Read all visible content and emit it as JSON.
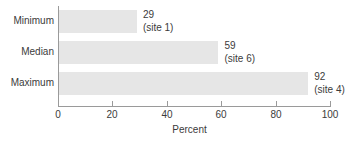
{
  "chart_data": {
    "type": "bar",
    "orientation": "horizontal",
    "title": "",
    "subtitle": "",
    "xlabel": "Percent",
    "ylabel": "",
    "xlim": [
      0,
      100
    ],
    "grid": false,
    "legend": null,
    "categories": [
      "Minimum",
      "Median",
      "Maximum"
    ],
    "values": [
      29,
      59,
      92
    ],
    "annotations": [
      "(site 1)",
      "(site 6)",
      "(site 4)"
    ],
    "value_labels": [
      "29",
      "59",
      "92"
    ],
    "xticks": [
      0,
      20,
      40,
      60,
      80,
      100
    ],
    "xtick_labels": [
      "0",
      "20",
      "40",
      "60",
      "80",
      "100"
    ],
    "series": [
      {
        "name": "Percent",
        "points": [
          {
            "category": "Minimum",
            "value": 29,
            "value_label": "29",
            "annotation": "(site 1)"
          },
          {
            "category": "Median",
            "value": 59,
            "value_label": "59",
            "annotation": "(site 6)"
          },
          {
            "category": "Maximum",
            "value": 92,
            "value_label": "92",
            "annotation": "(site 4)"
          }
        ]
      }
    ],
    "colors": {
      "bar_fill": "#e6e6e6",
      "axis": "#9a9a9a",
      "text": "#3b3b3b",
      "background": "#ffffff"
    }
  }
}
